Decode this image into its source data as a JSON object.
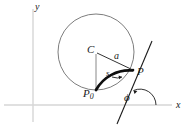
{
  "figure": {
    "kind": "geometry-diagram",
    "background_color": "#ffffff",
    "axes": {
      "color": "#d4d4d4",
      "x_label": "x",
      "y_label": "y",
      "x_axis_y": 105,
      "y_axis_x": 33
    },
    "circle": {
      "color": "#6b6b6b",
      "center_x": 96,
      "center_y": 52,
      "radius": 38,
      "center_label": "C"
    },
    "radius_segment": {
      "label": "a",
      "from": "C",
      "to": "P",
      "color": "#2a2a2a"
    },
    "vertical_segment": {
      "from": "C",
      "to": "P0",
      "color": "#6b6b6b"
    },
    "arc": {
      "label": "s",
      "from": "P0",
      "to": "P",
      "color": "#111111",
      "style": "thick"
    },
    "points": [
      {
        "name": "P",
        "label": "P",
        "x": 133,
        "y": 70
      },
      {
        "name": "P0",
        "label": "P",
        "sub": "0",
        "x": 96,
        "y": 90
      }
    ],
    "tangent_line": {
      "color": "#1a1a1a",
      "x1": 152,
      "y1": 41,
      "x2": 117,
      "y2": 124
    },
    "angle": {
      "symbol": "ϕ",
      "vertex_x": 140,
      "vertex_y": 105,
      "between": [
        "x-axis",
        "tangent-line"
      ]
    },
    "labels": {
      "center": "C",
      "radius": "a",
      "arc_length": "s",
      "point_p": "P",
      "point_p0_base": "P",
      "point_p0_sub": "0",
      "angle_phi": "ϕ",
      "axis_x": "x",
      "axis_y": "y"
    }
  }
}
